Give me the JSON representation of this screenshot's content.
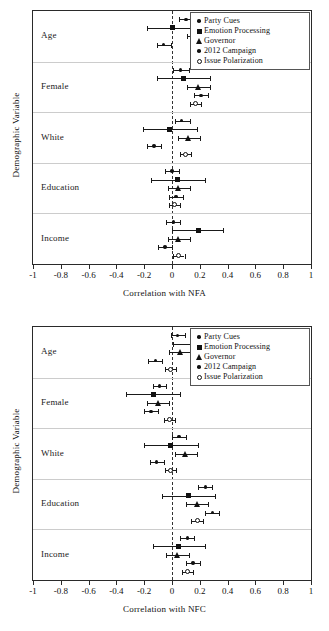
{
  "figure": {
    "y_axis_title": "Demographic Variable",
    "marker_color": "#111111",
    "grid_color": "#cccccc"
  },
  "legend": {
    "entries": [
      {
        "label": "Party Cues",
        "marker": "dot-sm"
      },
      {
        "label": "Emotion Processing",
        "marker": "square"
      },
      {
        "label": "Governor",
        "marker": "triangle"
      },
      {
        "label": "2012 Campaign",
        "marker": "dot-sm"
      },
      {
        "label": "Issue Polarization",
        "marker": "circle"
      }
    ]
  },
  "chart_data": [
    {
      "type": "scatter",
      "id": "nfa",
      "title": "",
      "xlabel": "Correlation with NFA",
      "ylabel": "Demographic Variable",
      "xlim": [
        -1,
        1
      ],
      "xticks": [
        -1,
        -0.8,
        -0.6,
        -0.4,
        -0.2,
        0,
        0.2,
        0.4,
        0.6,
        0.8,
        1
      ],
      "xticklabels": [
        "-1",
        "-0.8",
        "-0.6",
        "-0.4",
        "-0.2",
        "0",
        "0.2",
        "0.4",
        "0.6",
        "0.8",
        "1"
      ],
      "grid": false,
      "zero_reference_line": 0,
      "legend_position": "top-right",
      "categories": [
        "Age",
        "Female",
        "White",
        "Education",
        "Income"
      ],
      "series": [
        {
          "name": "Party Cues",
          "marker": "dot-sm",
          "points": [
            {
              "category": "Age",
              "value": 0.1,
              "ci_low": 0.05,
              "ci_high": 0.15
            },
            {
              "category": "Female",
              "value": 0.06,
              "ci_low": 0.01,
              "ci_high": 0.12
            },
            {
              "category": "White",
              "value": 0.07,
              "ci_low": 0.02,
              "ci_high": 0.13
            },
            {
              "category": "Education",
              "value": 0.0,
              "ci_low": -0.05,
              "ci_high": 0.05
            },
            {
              "category": "Income",
              "value": 0.01,
              "ci_low": -0.04,
              "ci_high": 0.06
            }
          ]
        },
        {
          "name": "Emotion Processing",
          "marker": "square",
          "points": [
            {
              "category": "Age",
              "value": 0.0,
              "ci_low": -0.18,
              "ci_high": 0.19
            },
            {
              "category": "Female",
              "value": 0.08,
              "ci_low": -0.11,
              "ci_high": 0.27
            },
            {
              "category": "White",
              "value": -0.02,
              "ci_low": -0.21,
              "ci_high": 0.18
            },
            {
              "category": "Education",
              "value": 0.04,
              "ci_low": -0.15,
              "ci_high": 0.24
            },
            {
              "category": "Income",
              "value": 0.19,
              "ci_low": 0.0,
              "ci_high": 0.37
            }
          ]
        },
        {
          "name": "Governor",
          "marker": "triangle",
          "points": [
            {
              "category": "Age",
              "value": 0.19,
              "ci_low": 0.11,
              "ci_high": 0.27
            },
            {
              "category": "Female",
              "value": 0.19,
              "ci_low": 0.11,
              "ci_high": 0.27
            },
            {
              "category": "White",
              "value": 0.12,
              "ci_low": 0.04,
              "ci_high": 0.2
            },
            {
              "category": "Education",
              "value": 0.05,
              "ci_low": -0.03,
              "ci_high": 0.13
            },
            {
              "category": "Income",
              "value": 0.05,
              "ci_low": -0.03,
              "ci_high": 0.13
            }
          ]
        },
        {
          "name": "2012 Campaign",
          "marker": "dot-sm",
          "points": [
            {
              "category": "Age",
              "value": -0.06,
              "ci_low": -0.11,
              "ci_high": -0.01
            },
            {
              "category": "Female",
              "value": 0.21,
              "ci_low": 0.16,
              "ci_high": 0.26
            },
            {
              "category": "White",
              "value": -0.13,
              "ci_low": -0.18,
              "ci_high": -0.08
            },
            {
              "category": "Education",
              "value": 0.03,
              "ci_low": -0.02,
              "ci_high": 0.08
            },
            {
              "category": "Income",
              "value": -0.05,
              "ci_low": -0.1,
              "ci_high": 0.0
            }
          ]
        },
        {
          "name": "Issue Polarization",
          "marker": "circle",
          "points": [
            {
              "category": "Age",
              "value": 0.2,
              "ci_low": 0.16,
              "ci_high": 0.24
            },
            {
              "category": "Female",
              "value": 0.17,
              "ci_low": 0.13,
              "ci_high": 0.21
            },
            {
              "category": "White",
              "value": 0.1,
              "ci_low": 0.06,
              "ci_high": 0.14
            },
            {
              "category": "Education",
              "value": 0.02,
              "ci_low": -0.02,
              "ci_high": 0.06
            },
            {
              "category": "Income",
              "value": 0.05,
              "ci_low": 0.01,
              "ci_high": 0.09
            }
          ]
        }
      ]
    },
    {
      "type": "scatter",
      "id": "nfc",
      "title": "",
      "xlabel": "Correlation with NFC",
      "ylabel": "Demographic Variable",
      "xlim": [
        -1,
        1
      ],
      "xticks": [
        -1,
        -0.8,
        -0.6,
        -0.4,
        -0.2,
        0,
        0.2,
        0.4,
        0.6,
        0.8,
        1
      ],
      "xticklabels": [
        "-1",
        "-0.8",
        "-0.6",
        "-0.4",
        "-0.2",
        "0",
        "0.2",
        "0.4",
        "0.6",
        "0.8",
        "1"
      ],
      "grid": false,
      "zero_reference_line": 0,
      "legend_position": "top-right",
      "categories": [
        "Age",
        "Female",
        "White",
        "Education",
        "Income"
      ],
      "series": [
        {
          "name": "Party Cues",
          "marker": "dot-sm",
          "points": [
            {
              "category": "Age",
              "value": 0.04,
              "ci_low": -0.01,
              "ci_high": 0.09
            },
            {
              "category": "Female",
              "value": -0.09,
              "ci_low": -0.14,
              "ci_high": -0.04
            },
            {
              "category": "White",
              "value": 0.05,
              "ci_low": 0.0,
              "ci_high": 0.1
            },
            {
              "category": "Education",
              "value": 0.24,
              "ci_low": 0.19,
              "ci_high": 0.29
            },
            {
              "category": "Income",
              "value": 0.11,
              "ci_low": 0.06,
              "ci_high": 0.16
            }
          ]
        },
        {
          "name": "Emotion Processing",
          "marker": "square",
          "points": [
            {
              "category": "Age",
              "value": 0.2,
              "ci_low": 0.01,
              "ci_high": 0.38
            },
            {
              "category": "Female",
              "value": -0.13,
              "ci_low": -0.33,
              "ci_high": 0.06
            },
            {
              "category": "White",
              "value": -0.01,
              "ci_low": -0.2,
              "ci_high": 0.19
            },
            {
              "category": "Education",
              "value": 0.12,
              "ci_low": -0.07,
              "ci_high": 0.31
            },
            {
              "category": "Income",
              "value": 0.05,
              "ci_low": -0.14,
              "ci_high": 0.24
            }
          ]
        },
        {
          "name": "Governor",
          "marker": "triangle",
          "points": [
            {
              "category": "Age",
              "value": 0.06,
              "ci_low": -0.02,
              "ci_high": 0.14
            },
            {
              "category": "Female",
              "value": -0.1,
              "ci_low": -0.18,
              "ci_high": -0.02
            },
            {
              "category": "White",
              "value": 0.1,
              "ci_low": 0.02,
              "ci_high": 0.18
            },
            {
              "category": "Education",
              "value": 0.18,
              "ci_low": 0.1,
              "ci_high": 0.26
            },
            {
              "category": "Income",
              "value": 0.04,
              "ci_low": -0.04,
              "ci_high": 0.12
            }
          ]
        },
        {
          "name": "2012 Campaign",
          "marker": "dot-sm",
          "points": [
            {
              "category": "Age",
              "value": -0.12,
              "ci_low": -0.17,
              "ci_high": -0.07
            },
            {
              "category": "Female",
              "value": -0.15,
              "ci_low": -0.2,
              "ci_high": -0.1
            },
            {
              "category": "White",
              "value": -0.11,
              "ci_low": -0.16,
              "ci_high": -0.06
            },
            {
              "category": "Education",
              "value": 0.29,
              "ci_low": 0.24,
              "ci_high": 0.34
            },
            {
              "category": "Income",
              "value": 0.15,
              "ci_low": 0.1,
              "ci_high": 0.2
            }
          ]
        },
        {
          "name": "Issue Polarization",
          "marker": "circle",
          "points": [
            {
              "category": "Age",
              "value": -0.01,
              "ci_low": -0.05,
              "ci_high": 0.03
            },
            {
              "category": "Female",
              "value": -0.02,
              "ci_low": -0.06,
              "ci_high": 0.02
            },
            {
              "category": "White",
              "value": -0.01,
              "ci_low": -0.05,
              "ci_high": 0.03
            },
            {
              "category": "Education",
              "value": 0.18,
              "ci_low": 0.14,
              "ci_high": 0.22
            },
            {
              "category": "Income",
              "value": 0.11,
              "ci_low": 0.07,
              "ci_high": 0.15
            }
          ]
        }
      ]
    }
  ]
}
